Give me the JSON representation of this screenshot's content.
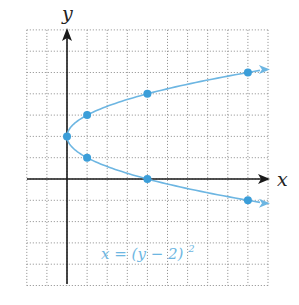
{
  "chart_data": {
    "type": "line",
    "title": "",
    "xlabel": "x",
    "ylabel": "y",
    "xlim": [
      -2,
      10
    ],
    "ylim": [
      -5,
      7
    ],
    "grid": true,
    "grid_style": "dotted",
    "series": [
      {
        "name": "x = (y − 2)²",
        "equation": "x = (y - 2)^2",
        "color": "#6db6e2",
        "marker_color": "#3b9ed9",
        "points": [
          {
            "x": 9,
            "y": 5
          },
          {
            "x": 4,
            "y": 4
          },
          {
            "x": 1,
            "y": 3
          },
          {
            "x": 0,
            "y": 2
          },
          {
            "x": 1,
            "y": 1
          },
          {
            "x": 4,
            "y": 0
          },
          {
            "x": 9,
            "y": -1
          }
        ]
      }
    ],
    "annotations": [
      {
        "text": "x = (y − 2)²",
        "position": "lower middle"
      }
    ]
  },
  "labels": {
    "x_axis": "x",
    "y_axis": "y",
    "equation_main": "x = (y − 2)",
    "equation_exp": "2"
  }
}
